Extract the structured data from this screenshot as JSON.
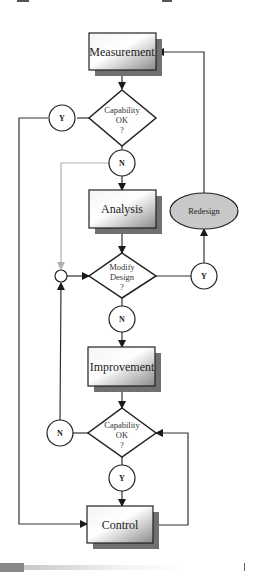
{
  "diagram": {
    "nodes": {
      "measurement": {
        "label": "Measurement"
      },
      "capability1": {
        "line1": "Capability",
        "line2": "OK",
        "line3": "?"
      },
      "cap1_yes": {
        "label": "Y"
      },
      "cap1_no": {
        "label": "N"
      },
      "analysis": {
        "label": "Analysis"
      },
      "redesign": {
        "label": "Redesign"
      },
      "modify": {
        "line1": "Modify",
        "line2": "Design",
        "line3": "?"
      },
      "modify_yes": {
        "label": "Y"
      },
      "modify_no": {
        "label": "N"
      },
      "improvement": {
        "label": "Improvement"
      },
      "capability2": {
        "line1": "Capability",
        "line2": "OK",
        "line3": "?"
      },
      "cap2_no": {
        "label": "N"
      },
      "cap2_yes": {
        "label": "Y"
      },
      "control": {
        "label": "Control"
      }
    },
    "colors": {
      "line": "#333333",
      "gray_line": "#b0b0b0",
      "shadow": "#707070",
      "ellipse_fill": "#c8c8c8"
    }
  }
}
